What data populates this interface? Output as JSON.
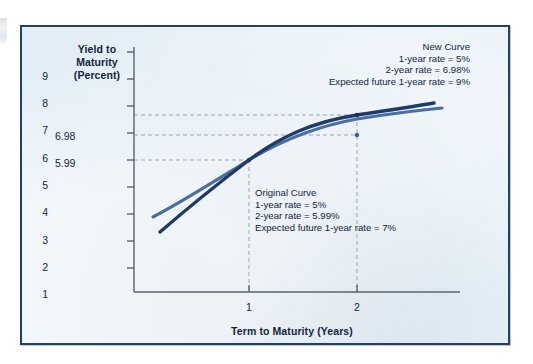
{
  "figure": {
    "background_color": "#e3eef6",
    "border_color": "#22406b"
  },
  "chart_data": {
    "type": "line",
    "title": "",
    "xlabel": "Term to Maturity (Years)",
    "ylabel": "Yield to Maturity (Percent)",
    "xlim": [
      0,
      2.8
    ],
    "ylim": [
      0,
      9.6
    ],
    "xticks": [
      "1",
      "2"
    ],
    "yticks": [
      "1",
      "2",
      "3",
      "4",
      "5",
      "6",
      "7",
      "8",
      "9"
    ],
    "grid": false,
    "legend": "none",
    "series": [
      {
        "name": "Original Curve",
        "color": "#4a6ea0",
        "x": [
          0.23,
          0.5,
          0.75,
          1.0,
          1.25,
          1.5,
          1.75,
          2.0,
          2.3,
          2.65
        ],
        "y": [
          2.98,
          3.65,
          4.35,
          5.0,
          5.32,
          5.56,
          5.8,
          5.99,
          6.1,
          6.21
        ]
      },
      {
        "name": "New Curve",
        "color": "#1d3a6b",
        "x": [
          0.3,
          0.55,
          0.8,
          1.0,
          1.25,
          1.5,
          1.75,
          2.0,
          2.3,
          2.55
        ],
        "y": [
          2.45,
          3.2,
          4.2,
          5.0,
          5.65,
          6.2,
          6.65,
          6.98,
          7.25,
          7.4
        ]
      }
    ],
    "markers": [
      {
        "label": "crossover",
        "x": 1.0,
        "y": 5.0
      },
      {
        "label": "new-curve-2yr",
        "x": 2.0,
        "y": 6.98
      },
      {
        "label": "original-curve-2yr",
        "x": 2.0,
        "y": 5.99
      }
    ],
    "guide_values": [
      "6.98",
      "5.99"
    ],
    "annotations": [
      {
        "name": "new-curve",
        "align": "right",
        "lines": [
          "New Curve",
          "1-year rate = 5%",
          "2-year rate = 6.98%",
          "Expected future 1-year rate = 9%"
        ]
      },
      {
        "name": "original-curve",
        "align": "left",
        "lines": [
          "Original Curve",
          "1-year rate = 5%",
          "2-year rate = 5.99%",
          "Expected future 1-year rate = 7%"
        ]
      }
    ]
  }
}
